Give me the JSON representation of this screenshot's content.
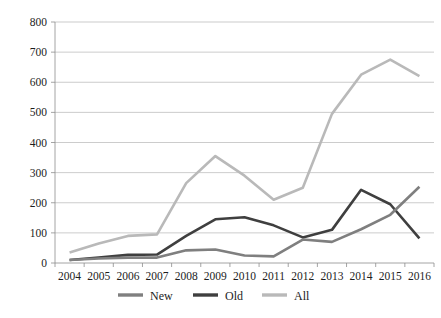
{
  "figure": {
    "cropped_title_fragment": "",
    "background_color": "#ffffff"
  },
  "chart_data": {
    "type": "line",
    "title": "",
    "subtitle": "",
    "xlabel": "",
    "ylabel": "",
    "categories": [
      "2004",
      "2005",
      "2006",
      "2007",
      "2008",
      "2009",
      "2010",
      "2011",
      "2012",
      "2013",
      "2014",
      "2015",
      "2016"
    ],
    "x": [
      2004,
      2005,
      2006,
      2007,
      2008,
      2009,
      2010,
      2011,
      2012,
      2013,
      2014,
      2015,
      2016
    ],
    "series": [
      {
        "name": "New",
        "color": "#7f7f7f",
        "values": [
          10,
          15,
          18,
          18,
          42,
          45,
          25,
          22,
          78,
          70,
          112,
          160,
          253
        ]
      },
      {
        "name": "Old",
        "color": "#3f3f3f",
        "values": [
          10,
          18,
          27,
          28,
          90,
          145,
          152,
          125,
          85,
          110,
          243,
          195,
          82
        ]
      },
      {
        "name": "All",
        "color": "#b9b9b9",
        "values": [
          35,
          65,
          90,
          95,
          265,
          355,
          290,
          210,
          250,
          495,
          625,
          675,
          620
        ]
      }
    ],
    "ylim": [
      0,
      800
    ],
    "yticks": [
      0,
      100,
      200,
      300,
      400,
      500,
      600,
      700,
      800
    ],
    "ytick_labels": [
      "0",
      "100",
      "200",
      "300",
      "400",
      "500",
      "600",
      "700",
      "800"
    ],
    "xtick_labels": [
      "2004",
      "2005",
      "2006",
      "2007",
      "2008",
      "2009",
      "2010",
      "2011",
      "2012",
      "2013",
      "2014",
      "2015",
      "2016"
    ],
    "grid": true,
    "grid_axis": "y",
    "grid_color": "#b6b6b6",
    "legend": {
      "position": "bottom",
      "entries": [
        {
          "label": "New",
          "color": "#7f7f7f"
        },
        {
          "label": "Old",
          "color": "#3f3f3f"
        },
        {
          "label": "All",
          "color": "#b9b9b9"
        }
      ]
    }
  }
}
